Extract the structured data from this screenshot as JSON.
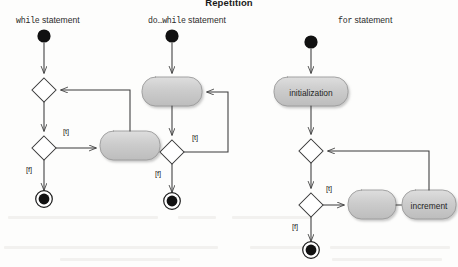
{
  "figure": {
    "title": "Repetition",
    "background_color": "#fdfdfc",
    "ink_color": "#3a3a3a",
    "node_fill": "#c9c9c9",
    "node_stroke": "#8f8f8f",
    "terminal_color": "#000000"
  },
  "columns": [
    {
      "id": "while",
      "label_mono": "while",
      "label_sans": " statement",
      "nodes": [
        {
          "name": "initial-node",
          "type": "initial",
          "label": ""
        },
        {
          "name": "merge-node",
          "type": "merge-diamond",
          "label": ""
        },
        {
          "name": "decision-node",
          "type": "decision-diamond",
          "label": ""
        },
        {
          "name": "body-activity",
          "type": "activity",
          "label": ""
        },
        {
          "name": "final-node",
          "type": "final",
          "label": ""
        }
      ],
      "guards": [
        {
          "name": "guard-true",
          "text": "[t]"
        },
        {
          "name": "guard-false",
          "text": "[f]"
        }
      ]
    },
    {
      "id": "dowhile",
      "label_mono": "do…while",
      "label_sans": " statement",
      "nodes": [
        {
          "name": "initial-node",
          "type": "initial",
          "label": ""
        },
        {
          "name": "body-activity",
          "type": "activity",
          "label": ""
        },
        {
          "name": "decision-node",
          "type": "decision-diamond",
          "label": ""
        },
        {
          "name": "final-node",
          "type": "final",
          "label": ""
        }
      ],
      "guards": [
        {
          "name": "guard-true",
          "text": "[t]"
        },
        {
          "name": "guard-false",
          "text": "[f]"
        }
      ]
    },
    {
      "id": "for",
      "label_mono": "for",
      "label_sans": " statement",
      "nodes": [
        {
          "name": "initial-node",
          "type": "initial",
          "label": ""
        },
        {
          "name": "initialization-activity",
          "type": "activity",
          "label": "initialization"
        },
        {
          "name": "merge-node",
          "type": "merge-diamond",
          "label": ""
        },
        {
          "name": "decision-node",
          "type": "decision-diamond",
          "label": ""
        },
        {
          "name": "body-activity",
          "type": "activity",
          "label": ""
        },
        {
          "name": "increment-activity",
          "type": "activity",
          "label": "increment"
        },
        {
          "name": "final-node",
          "type": "final",
          "label": ""
        }
      ],
      "guards": [
        {
          "name": "guard-true",
          "text": "[t]"
        },
        {
          "name": "guard-false",
          "text": "[f]"
        }
      ]
    }
  ],
  "guard_labels": {
    "while_true": "[t]",
    "while_false": "[f]",
    "dowhile_true": "[t]",
    "dowhile_false": "[f]",
    "for_true": "[t]",
    "for_false": "[f]"
  },
  "activity_labels": {
    "initialization": "initialization",
    "increment": "increment"
  }
}
